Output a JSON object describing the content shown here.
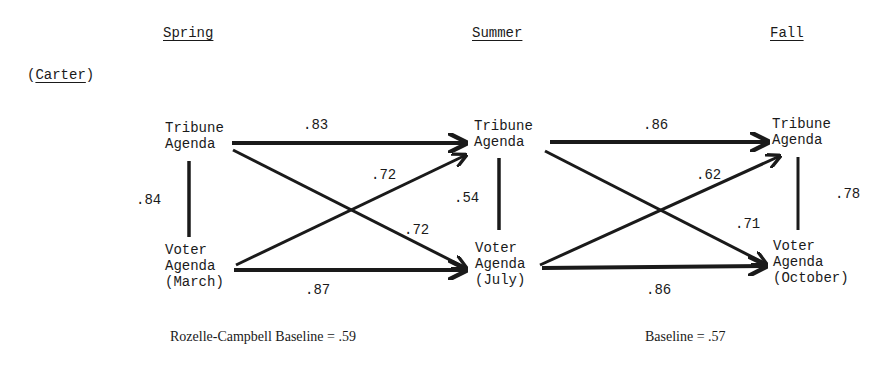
{
  "headers": {
    "spring": "Spring",
    "summer": "Summer",
    "fall": "Fall"
  },
  "candidate_label": "(Carter)",
  "nodes": {
    "spring_tribune": {
      "line1": "Tribune",
      "line2": "Agenda"
    },
    "spring_voter": {
      "line1": "Voter",
      "line2": "Agenda",
      "line3": "(March)"
    },
    "summer_tribune": {
      "line1": "Tribune",
      "line2": "Agenda"
    },
    "summer_voter": {
      "line1": "Voter",
      "line2": "Agenda",
      "line3": "(July)"
    },
    "fall_tribune": {
      "line1": "Tribune",
      "line2": "Agenda"
    },
    "fall_voter": {
      "line1": "Voter",
      "line2": "Agenda",
      "line3": "(October)"
    }
  },
  "correlations": {
    "spring_tribune_to_summer_tribune": ".83",
    "spring_voter_to_summer_tribune": ".72",
    "spring_tribune_to_summer_voter": ".72",
    "spring_voter_to_summer_voter": ".87",
    "spring_tribune_voter": ".84",
    "summer_tribune_voter": ".54",
    "summer_tribune_to_fall_tribune": ".86",
    "summer_voter_to_fall_tribune": ".62",
    "summer_tribune_to_fall_voter": ".71",
    "summer_voter_to_fall_voter": ".86",
    "fall_tribune_voter": ".78"
  },
  "baselines": {
    "left": "Rozelle-Campbell Baseline = .59",
    "right": "Baseline = .57"
  },
  "colors": {
    "ink": "#1a1a1a",
    "background": "#ffffff"
  }
}
